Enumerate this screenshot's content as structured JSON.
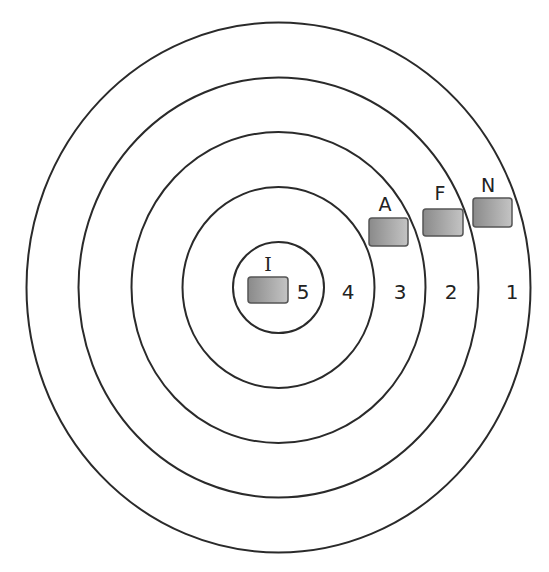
{
  "diagram": {
    "type": "concentric-target",
    "center": {
      "x": 278.5,
      "y": 287.5
    },
    "line_color": "#2a2a2a",
    "rings": [
      {
        "zone": "1",
        "rx": 252,
        "ry": 265
      },
      {
        "zone": "2",
        "rx": 200,
        "ry": 210
      },
      {
        "zone": "3",
        "rx": 147,
        "ry": 155.5
      },
      {
        "zone": "4",
        "rx": 96,
        "ry": 100.5
      },
      {
        "zone": "5",
        "rx": 45.5,
        "ry": 45.5
      }
    ],
    "zone_labels": [
      {
        "text": "5",
        "x": 303,
        "y": 292
      },
      {
        "text": "4",
        "x": 348,
        "y": 292
      },
      {
        "text": "3",
        "x": 400,
        "y": 292
      },
      {
        "text": "2",
        "x": 451,
        "y": 292
      },
      {
        "text": "1",
        "x": 512,
        "y": 292
      }
    ],
    "markers": [
      {
        "label": "I",
        "box": {
          "x": 248,
          "y": 277,
          "w": 40,
          "h": 26
        },
        "label_pos": {
          "x": 268,
          "y": 264
        }
      },
      {
        "label": "A",
        "box": {
          "x": 369,
          "y": 218,
          "w": 39,
          "h": 28
        },
        "label_pos": {
          "x": 385,
          "y": 204
        }
      },
      {
        "label": "F",
        "box": {
          "x": 423,
          "y": 209,
          "w": 40,
          "h": 27
        },
        "label_pos": {
          "x": 440,
          "y": 193
        }
      },
      {
        "label": "N",
        "box": {
          "x": 473,
          "y": 198,
          "w": 39,
          "h": 29
        },
        "label_pos": {
          "x": 488,
          "y": 185
        }
      }
    ],
    "marker_fill": {
      "dark": "#8a8a8a",
      "light": "#c4c4c4",
      "border": "#555555"
    }
  }
}
